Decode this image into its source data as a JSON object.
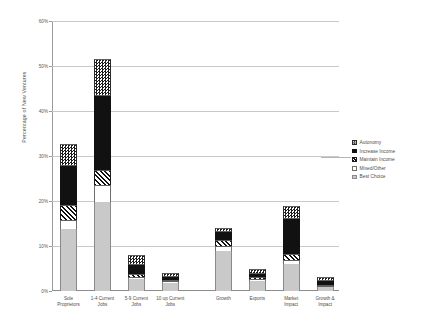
{
  "chart_data": {
    "type": "bar",
    "subtype": "stacked-bar",
    "title": "",
    "xlabel": "",
    "ylabel": "Percentage of New Ventures",
    "ylim": [
      0,
      60
    ],
    "ytick_labels": [
      "0%",
      "10%",
      "20%",
      "30%",
      "40%",
      "50%",
      "60%"
    ],
    "ytick_values": [
      0,
      10,
      20,
      30,
      40,
      50,
      60
    ],
    "grid": true,
    "legend_position": "right",
    "categories": [
      "Sole Proprietors",
      "1-4 Current Jobs",
      "5-9 Current Jobs",
      "10 up Current Jobs",
      "Growth",
      "Exports",
      "Market Impact",
      "Growth & Impact"
    ],
    "category_lines": [
      [
        "Sole",
        "Proprietors"
      ],
      [
        "1-4 Current",
        "Jobs"
      ],
      [
        "5-9 Current",
        "Jobs"
      ],
      [
        "10 up Current",
        "Jobs"
      ],
      [
        "Growth",
        ""
      ],
      [
        "Exports",
        ""
      ],
      [
        "Market",
        "Impact"
      ],
      [
        "Growth &",
        "Impact"
      ]
    ],
    "series": [
      {
        "name": "Best Choice",
        "pattern": "solid-light-gray",
        "values": [
          13.8,
          19.8,
          2.6,
          1.8,
          9.0,
          2.2,
          6.0,
          0.9
        ]
      },
      {
        "name": "Mixed/Other",
        "pattern": "white",
        "values": [
          2.0,
          3.7,
          0.6,
          0.4,
          1.1,
          0.5,
          0.9,
          0.2
        ]
      },
      {
        "name": "Maintain Income",
        "pattern": "diagonal-hatch",
        "values": [
          3.3,
          3.5,
          0.5,
          0.3,
          1.3,
          0.4,
          1.4,
          0.3
        ]
      },
      {
        "name": "Increase Income",
        "pattern": "solid-black",
        "values": [
          9.0,
          16.5,
          2.4,
          0.9,
          2.0,
          0.9,
          8.0,
          1.0
        ]
      },
      {
        "name": "Autonomy",
        "pattern": "checkerboard",
        "values": [
          4.6,
          8.0,
          1.9,
          0.6,
          0.6,
          0.9,
          2.7,
          0.6
        ]
      }
    ],
    "totals": [
      32.7,
      51.5,
      8.0,
      4.0,
      14.0,
      4.9,
      19.0,
      3.0
    ]
  },
  "legend": {
    "items": [
      {
        "label": "Autonomy",
        "swatch": "checkerboard-swatch"
      },
      {
        "label": "Increase Income",
        "swatch": "solid-black-swatch"
      },
      {
        "label": "Maintain Income",
        "swatch": "diagonal-hatch-swatch"
      },
      {
        "label": "Mixed/Other",
        "swatch": "white-swatch"
      },
      {
        "label": "Best Choice",
        "swatch": "light-gray-swatch"
      }
    ]
  }
}
